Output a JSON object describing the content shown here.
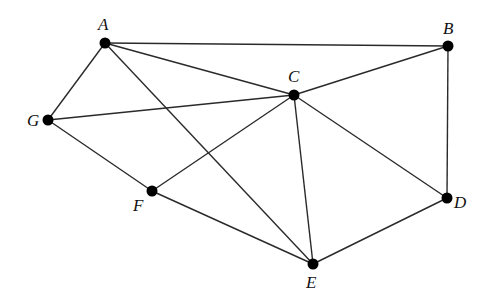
{
  "diagram": {
    "type": "graph",
    "nodes": [
      {
        "id": "A",
        "label": "A",
        "x": 105,
        "y": 43,
        "lx": 98,
        "ly": 30
      },
      {
        "id": "B",
        "label": "B",
        "x": 448,
        "y": 46,
        "lx": 443,
        "ly": 34
      },
      {
        "id": "C",
        "label": "C",
        "x": 294,
        "y": 95,
        "lx": 288,
        "ly": 82
      },
      {
        "id": "D",
        "label": "D",
        "x": 447,
        "y": 198,
        "lx": 454,
        "ly": 208
      },
      {
        "id": "E",
        "label": "E",
        "x": 313,
        "y": 264,
        "lx": 306,
        "ly": 288
      },
      {
        "id": "F",
        "label": "F",
        "x": 152,
        "y": 191,
        "lx": 133,
        "ly": 211
      },
      {
        "id": "G",
        "label": "G",
        "x": 48,
        "y": 120,
        "lx": 27,
        "ly": 126
      }
    ],
    "edges": [
      [
        "A",
        "B"
      ],
      [
        "A",
        "C"
      ],
      [
        "A",
        "G"
      ],
      [
        "A",
        "E"
      ],
      [
        "B",
        "C"
      ],
      [
        "B",
        "D"
      ],
      [
        "C",
        "G"
      ],
      [
        "C",
        "F"
      ],
      [
        "C",
        "E"
      ],
      [
        "C",
        "D"
      ],
      [
        "G",
        "F"
      ],
      [
        "F",
        "E"
      ],
      [
        "E",
        "D"
      ]
    ]
  }
}
